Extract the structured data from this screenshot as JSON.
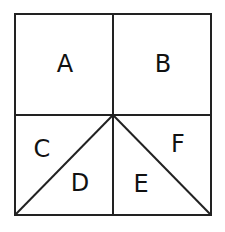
{
  "diagram": {
    "stroke_color": "#222222",
    "label_color": "#111111",
    "background": "#ffffff",
    "outer_square": {
      "x1": 15,
      "y1": 14,
      "x2": 211,
      "y2": 215
    },
    "center_point": {
      "x": 113,
      "y": 115
    },
    "regions": [
      {
        "id": "A",
        "label": "A",
        "x": 65,
        "y": 72
      },
      {
        "id": "B",
        "label": "B",
        "x": 163,
        "y": 72
      },
      {
        "id": "C",
        "label": "C",
        "x": 42,
        "y": 157
      },
      {
        "id": "D",
        "label": "D",
        "x": 80,
        "y": 191
      },
      {
        "id": "E",
        "label": "E",
        "x": 141,
        "y": 192
      },
      {
        "id": "F",
        "label": "F",
        "x": 178,
        "y": 152
      }
    ]
  }
}
